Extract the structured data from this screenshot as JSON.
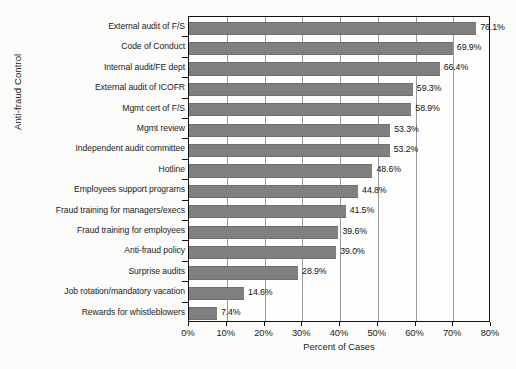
{
  "chart_data": {
    "type": "bar",
    "orientation": "horizontal",
    "title": "",
    "xlabel": "Percent of Cases",
    "ylabel": "Anti-fraud Control",
    "xlim": [
      0,
      80
    ],
    "xtick_labels": [
      "0%",
      "10%",
      "20%",
      "30%",
      "40%",
      "50%",
      "60%",
      "70%",
      "80%"
    ],
    "xtick_values": [
      0,
      10,
      20,
      30,
      40,
      50,
      60,
      70,
      80
    ],
    "grid": "vertical",
    "legend": "none",
    "bar_color": "#808080",
    "categories": [
      "External audit of F/S",
      "Code of Conduct",
      "Internal audit/FE dept",
      "External audit of ICOFR",
      "Mgmt cert of F/S",
      "Mgmt review",
      "Independent audit committee",
      "Hotline",
      "Employees support programs",
      "Fraud training for managers/execs",
      "Fraud training for employees",
      "Anti-fraud policy",
      "Surprise audits",
      "Job rotation/mandatory vacation",
      "Rewards for whistleblowers"
    ],
    "values": [
      76.1,
      69.9,
      66.4,
      59.3,
      58.9,
      53.3,
      53.2,
      48.6,
      44.8,
      41.5,
      39.6,
      39.0,
      28.9,
      14.6,
      7.4
    ],
    "value_labels": [
      "76.1%",
      "69.9%",
      "66.4%",
      "59.3%",
      "58.9%",
      "53.3%",
      "53.2%",
      "48.6%",
      "44.8%",
      "41.5%",
      "39.6%",
      "39.0%",
      "28.9%",
      "14.6%",
      "7.4%"
    ]
  },
  "scan_artifact": {
    "bleed_text": ""
  }
}
